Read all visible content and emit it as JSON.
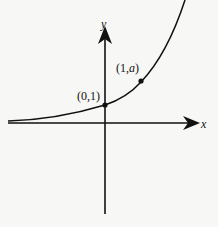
{
  "diagram": {
    "type": "exponential-graph",
    "axes": {
      "x_label": "x",
      "y_label": "y"
    },
    "points": [
      {
        "label": "(0,1)",
        "x": 0,
        "y": 1
      },
      {
        "label_prefix": "(1,",
        "label_var": "a",
        "label_suffix": ")",
        "x": 1,
        "y": "a"
      }
    ],
    "curve": "y = a^x (a > 1)",
    "colors": {
      "ink": "#111111",
      "background": "#f7f7f5"
    }
  }
}
